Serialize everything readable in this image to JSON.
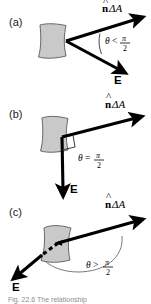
{
  "figure": {
    "background_color": "#ffffff",
    "patch_fill": "#c9c9c9",
    "patch_stroke": "#4a4a4a",
    "arrow_color": "#000000",
    "arc_color": "#6e6e6e"
  },
  "panels": [
    {
      "id": "a",
      "label": "(a)",
      "normal_label_n": "n",
      "normal_label_rest": "ΔA",
      "field_label": "E",
      "angle_symbol": "θ",
      "angle_relation": "<",
      "angle_value_numerator": "π",
      "angle_value_denominator": "2",
      "description": "angle between normal and field is less than pi over two"
    },
    {
      "id": "b",
      "label": "(b)",
      "normal_label_n": "n",
      "normal_label_rest": "ΔA",
      "field_label": "E",
      "angle_symbol": "θ",
      "angle_relation": "=",
      "angle_value_numerator": "π",
      "angle_value_denominator": "2",
      "description": "angle between normal and field equals pi over two, right angle marker shown"
    },
    {
      "id": "c",
      "label": "(c)",
      "normal_label_n": "n",
      "normal_label_rest": "ΔA",
      "field_label": "E",
      "angle_symbol": "θ",
      "angle_relation": ">",
      "angle_value_numerator": "π",
      "angle_value_denominator": "2",
      "description": "angle between normal and field is greater than pi over two, field passes behind patch shown dashed"
    }
  ],
  "caption": {
    "text": "Fig. 22.6 The relationship",
    "visible": "partially cut off at bottom edge"
  },
  "icons": {
    "hat": "circumflex-accent-icon",
    "arrowhead": "arrowhead-icon",
    "right-angle": "right-angle-marker-icon"
  }
}
